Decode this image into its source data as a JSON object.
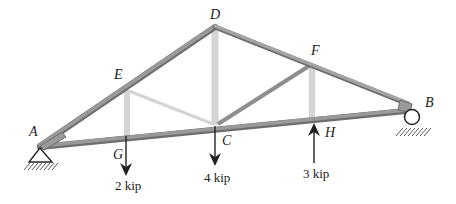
{
  "figure": {
    "type": "roof truss",
    "colors": {
      "member_dark": "#8c8c8c",
      "member_light": "#d2d2d2",
      "member_edge": "#6e6e6e",
      "ink": "#222222",
      "background": "#ffffff"
    }
  },
  "joints": {
    "A": "A",
    "B": "B",
    "C": "C",
    "D": "D",
    "E": "E",
    "F": "F",
    "G": "G",
    "H": "H"
  },
  "loads": [
    {
      "joint": "G",
      "label": "2 kip",
      "direction": "down"
    },
    {
      "joint": "C",
      "label": "4 kip",
      "direction": "down"
    },
    {
      "joint": "H",
      "label": "3 kip",
      "direction": "up"
    }
  ],
  "supports": [
    {
      "joint": "A",
      "type": "pin"
    },
    {
      "joint": "B",
      "type": "roller"
    }
  ],
  "members": [
    "AE",
    "ED",
    "DF",
    "FB",
    "AG",
    "GC",
    "CH",
    "HB",
    "EG",
    "EC",
    "DC",
    "FC",
    "FH"
  ]
}
